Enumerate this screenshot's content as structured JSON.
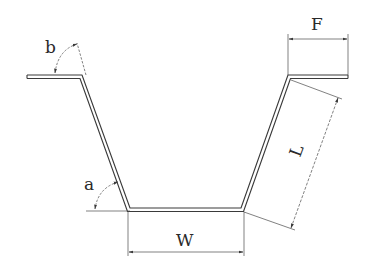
{
  "diagram": {
    "type": "sheet-metal hat/trough profile cross-section",
    "colors": {
      "stroke": "#3a3a3a",
      "background": "#ffffff"
    },
    "labels": {
      "angle_bottom": "a",
      "angle_top": "b",
      "flange_width": "F",
      "wall_length": "L",
      "base_width": "W"
    }
  }
}
